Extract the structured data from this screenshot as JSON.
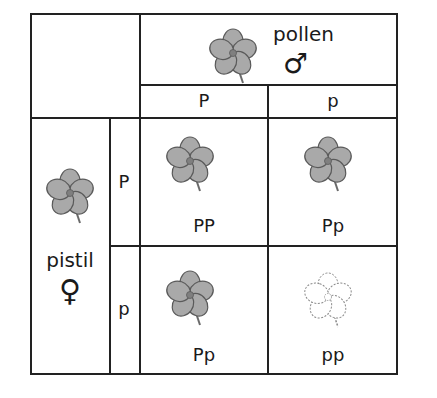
{
  "diagram": {
    "type": "punnett-square",
    "header": {
      "label": "pollen",
      "symbol": "male-symbol",
      "symbol_glyph": "♂",
      "flower": "purple-flower-icon"
    },
    "side": {
      "label": "pistil",
      "symbol": "female-symbol",
      "symbol_glyph": "♀",
      "flower": "purple-flower-icon"
    },
    "columns": [
      "P",
      "p"
    ],
    "rows": [
      "P",
      "p"
    ],
    "cells": [
      {
        "row": 0,
        "col": 0,
        "genotype": "PP",
        "phenotype": "colored"
      },
      {
        "row": 0,
        "col": 1,
        "genotype": "Pp",
        "phenotype": "colored"
      },
      {
        "row": 1,
        "col": 0,
        "genotype": "Pp",
        "phenotype": "colored"
      },
      {
        "row": 1,
        "col": 1,
        "genotype": "pp",
        "phenotype": "white"
      }
    ],
    "colors": {
      "petal_colored": "#a9a9a9",
      "petal_outline": "#5a5a5a",
      "petal_white": "#ffffff",
      "white_outline": "#8a8a8a",
      "grid": "#222222"
    }
  }
}
